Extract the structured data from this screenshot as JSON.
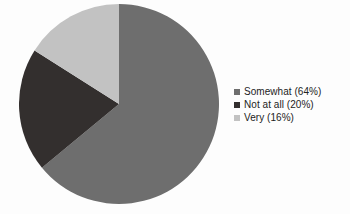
{
  "chart_data": {
    "type": "pie",
    "title": "",
    "xlabel": "",
    "ylabel": "",
    "categories": [
      "Somewhat",
      "Not at all",
      "Very"
    ],
    "values": [
      64,
      20,
      16
    ],
    "value_unit": "%",
    "slices": [
      {
        "label": "Somewhat",
        "value": 64,
        "percent": "64%",
        "legend_text": "Somewhat (64%)",
        "color": "#6e6e6e"
      },
      {
        "label": "Not at all",
        "value": 20,
        "percent": "20%",
        "legend_text": "Not at all (20%)",
        "color": "#332f2e"
      },
      {
        "label": "Very",
        "value": 16,
        "percent": "16%",
        "legend_text": "Very (16%)",
        "color": "#c2c2c2"
      }
    ],
    "start_angle_deg": 0,
    "direction": "clockwise",
    "legend_position": "right",
    "grid": false,
    "background_color": "#fdfdfd"
  },
  "legend": {
    "items": [
      {
        "label": "Somewhat (64%)",
        "color": "#6e6e6e"
      },
      {
        "label": "Not at all (20%)",
        "color": "#332f2e"
      },
      {
        "label": "Very (16%)",
        "color": "#c2c2c2"
      }
    ]
  }
}
